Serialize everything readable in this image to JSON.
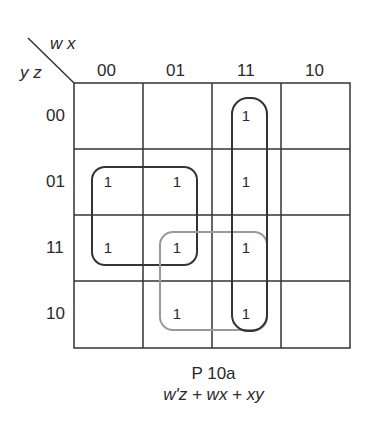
{
  "kmap": {
    "col_var_label": "w x",
    "row_var_label": "y z",
    "col_headers": [
      "00",
      "01",
      "11",
      "10"
    ],
    "row_headers": [
      "00",
      "01",
      "11",
      "10"
    ],
    "cells": [
      [
        "",
        "",
        "1",
        ""
      ],
      [
        "1",
        "1",
        "1",
        ""
      ],
      [
        "1",
        "1",
        "1",
        ""
      ],
      [
        "",
        "1",
        "1",
        ""
      ]
    ],
    "groups": [
      {
        "term": "w'z",
        "color": "#333333"
      },
      {
        "term": "wx",
        "color": "#333333"
      },
      {
        "term": "xy",
        "color": "#9a9a9a"
      }
    ]
  },
  "caption": {
    "title": "P 10a",
    "expression": "w'z + wx + xy"
  }
}
